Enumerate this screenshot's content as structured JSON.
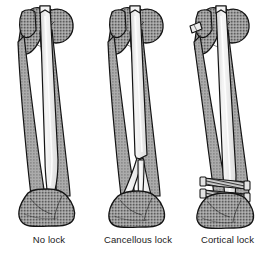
{
  "figure": {
    "background_color": "#ffffff",
    "title": "",
    "panel_count": 3
  },
  "palette": {
    "outline": "#141414",
    "bone_fill": "#8f8f8f",
    "bone_stipple_dark": "#5f5f5f",
    "bone_stipple_light": "#b4b4b4",
    "cortex_fill": "#a8a8a8",
    "nail_fill": "#efefef",
    "nail_shade": "#cfcfcf",
    "screw_fill": "#d8d8d8",
    "screw_hatch": "#333333",
    "caption_color": "#1a1a1a"
  },
  "panels": [
    {
      "id": "no-lock",
      "caption": "No lock",
      "bone": "femur",
      "implant": "intramedullary-nail",
      "distal_fixation": "none",
      "screw_count": 0,
      "description": "Femur with intramedullary nail, nail tip unlocked in distal metaphysis"
    },
    {
      "id": "cancellous-lock",
      "caption": "Cancellous lock",
      "bone": "femur",
      "implant": "intramedullary-nail",
      "distal_fixation": "expanding-prongs",
      "screw_count": 0,
      "description": "Femur with intramedullary nail splaying into divergent prongs in distal cancellous bone"
    },
    {
      "id": "cortical-lock",
      "caption": "Cortical lock",
      "bone": "femur",
      "implant": "intramedullary-nail",
      "distal_fixation": "transverse-interlocking-screws",
      "screw_count": 2,
      "description": "Femur with intramedullary nail secured by two transverse cortical interlocking screws distally"
    }
  ]
}
